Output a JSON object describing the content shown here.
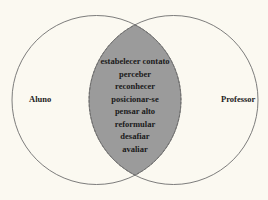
{
  "diagram": {
    "type": "venn",
    "left_set": {
      "label": "Aluno"
    },
    "right_set": {
      "label": "Professor"
    },
    "intersection": {
      "items": [
        "estabelecer contato",
        "perceber",
        "reconhecer",
        "posicionar-se",
        "pensar alto",
        "reformular",
        "desafiar",
        "avaliar"
      ]
    },
    "colors": {
      "background": "#fbf9f1",
      "circle_stroke": "#6e6e6e",
      "intersection_fill": "#9b9b9b",
      "intersection_stroke": "#555555"
    }
  }
}
